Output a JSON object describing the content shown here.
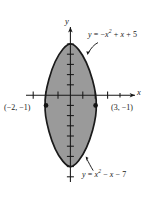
{
  "figure": {
    "kind": "cartesian-plot",
    "background_color": "#ffffff",
    "ink_color": "#171717",
    "region_fill_color": "#9a9a9a",
    "region_stroke_color": "#1a1a1a",
    "axes": {
      "x_axis_label": "x",
      "y_axis_label": "y",
      "x_tick_count": 7,
      "y_tick_count": 13,
      "origin_px": {
        "x": 70,
        "y": 95
      },
      "unit_px": {
        "x": 12.4,
        "y": 10.2
      },
      "x_range": [
        -3.6,
        4.5
      ],
      "y_range": [
        -8.6,
        6.6
      ]
    },
    "curves": [
      {
        "name": "upper-parabola",
        "label": "y = -x² + x + 5",
        "equation_html": "<i>y</i> = −<i>x</i><sup>2</sup> + <i>x</i> + 5",
        "coefficients": {
          "a": -1,
          "b": 1,
          "c": 5
        },
        "opens": "down",
        "vertex": [
          0.5,
          5.25
        ]
      },
      {
        "name": "lower-parabola",
        "label": "y = x² - x - 7",
        "equation_html": "<i>y</i> = <i>x</i><sup>2</sup> − <i>x</i> − 7",
        "coefficients": {
          "a": 1,
          "b": -1,
          "c": -7
        },
        "opens": "up",
        "vertex": [
          0.5,
          -7.25
        ]
      }
    ],
    "points": [
      {
        "name": "intersection-left",
        "label": "(−2, −1)",
        "x": -2,
        "y": -1
      },
      {
        "name": "intersection-right",
        "label": "(3, −1)",
        "x": 3,
        "y": -1
      }
    ],
    "shaded_region": {
      "description": "region bounded above by y = -x² + x + 5 and below by y = x² - x - 7",
      "x_from": -2,
      "x_to": 3
    }
  },
  "chart_data": {
    "type": "line",
    "title": "",
    "xlabel": "x",
    "ylabel": "y",
    "xlim": [
      -3.6,
      4.5
    ],
    "ylim": [
      -8.6,
      6.6
    ],
    "grid": false,
    "legend": "none",
    "series": [
      {
        "name": "y = -x² + x + 5",
        "x": [
          -2,
          -1.5,
          -1,
          -0.5,
          0,
          0.5,
          1,
          1.5,
          2,
          2.5,
          3
        ],
        "values": [
          -1,
          1.25,
          3,
          4.25,
          5,
          5.25,
          5,
          4.25,
          3,
          1.25,
          -1
        ]
      },
      {
        "name": "y = x² - x - 7",
        "x": [
          -2,
          -1.5,
          -1,
          -0.5,
          0,
          0.5,
          1,
          1.5,
          2,
          2.5,
          3
        ],
        "values": [
          -1,
          -3.25,
          -5,
          -6.25,
          -7,
          -7.25,
          -7,
          -6.25,
          -5,
          -3.25,
          -1
        ]
      }
    ],
    "annotations": [
      {
        "text": "y = -x² + x + 5",
        "target_x": 1.55,
        "target_y": 4.2
      },
      {
        "text": "y = x² - x - 7",
        "target_x": 1.3,
        "target_y": -6.6
      },
      {
        "text": "(−2, −1)",
        "target_x": -2,
        "target_y": -1
      },
      {
        "text": "(3, −1)",
        "target_x": 3,
        "target_y": -1
      }
    ]
  }
}
